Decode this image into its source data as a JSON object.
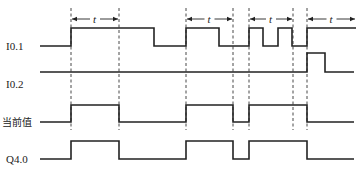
{
  "diagram": {
    "type": "timing-diagram",
    "signals": [
      {
        "id": "i01",
        "label": "I0.1",
        "low_y": 46,
        "high_y": 28,
        "x_start": 40,
        "x_end": 356,
        "edges": [
          71,
          154,
          186,
          219,
          249,
          263,
          278,
          292,
          307
        ],
        "initial": "low"
      },
      {
        "id": "i02",
        "label": "I0.2",
        "low_y": 72,
        "high_y": 53,
        "x_start": 40,
        "x_end": 354,
        "edges": [
          307,
          325
        ],
        "initial": "low"
      },
      {
        "id": "current",
        "label": "当前值",
        "low_y": 122,
        "high_y": 105,
        "x_start": 40,
        "x_end": 354,
        "edges": [
          71,
          119,
          186,
          233,
          249,
          307
        ],
        "initial": "low"
      },
      {
        "id": "q40",
        "label": "Q4.0",
        "low_y": 159,
        "high_y": 141,
        "x_start": 40,
        "x_end": 354,
        "edges": [
          71,
          119,
          186,
          233,
          249,
          307
        ],
        "initial": "low"
      }
    ],
    "dashed_lines": [
      71,
      119,
      186,
      233,
      249,
      293,
      307
    ],
    "dashed_range": {
      "y1": 8,
      "y2": 130
    },
    "intervals": [
      {
        "label": "t",
        "x1": 71,
        "x2": 119
      },
      {
        "label": "t",
        "x1": 186,
        "x2": 233
      },
      {
        "label": "t",
        "x1": 249,
        "x2": 293
      },
      {
        "label": "t",
        "x1": 307,
        "x2": 356
      }
    ],
    "interval_y": 19
  }
}
